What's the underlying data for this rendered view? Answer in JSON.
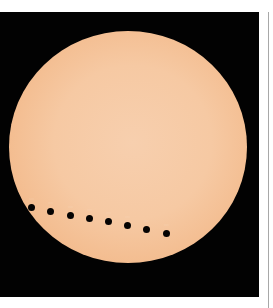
{
  "image": {
    "subject": "Transit of Venus across the Sun (time-lapse composite)",
    "colors": {
      "background": "#020202",
      "sun_center": "#f7cfae",
      "sun_limb": "#e79358",
      "planet": "#050302",
      "label": "#fff2e6",
      "page": "#ffffff",
      "side_rule": "#a8a8a8"
    },
    "sun": {
      "cx": 128,
      "cy": 147,
      "rx": 119,
      "ry": 116
    },
    "transit_points": [
      {
        "x": 31,
        "y": 207,
        "label": "··:··"
      },
      {
        "x": 50,
        "y": 211,
        "label": "··:··"
      },
      {
        "x": 70,
        "y": 215,
        "label": "··:··"
      },
      {
        "x": 89,
        "y": 218,
        "label": "··:··"
      },
      {
        "x": 108,
        "y": 221,
        "label": "··:··"
      },
      {
        "x": 127,
        "y": 225,
        "label": "··:··"
      },
      {
        "x": 146,
        "y": 229,
        "label": "··:··"
      },
      {
        "x": 166,
        "y": 233,
        "label": "··:··"
      }
    ]
  }
}
